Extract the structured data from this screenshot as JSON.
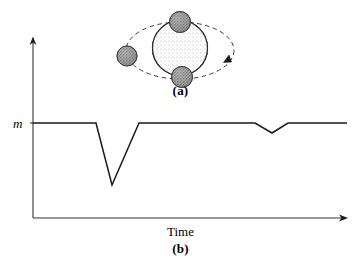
{
  "figure": {
    "panel_a": {
      "caption": "(a)",
      "description": "star-with-three-transiting-planets",
      "orbit_direction_arrow": "clockwise",
      "star": {
        "name": "central-star",
        "cx": 180,
        "cy": 48,
        "r": 27.5,
        "fill": "#f2f2f2",
        "stipple": "light"
      },
      "orbit": {
        "cx": 180,
        "cy": 50.5,
        "rx": 54,
        "ry": 28.5,
        "style": "dashed"
      },
      "planets": [
        {
          "name": "planet-top",
          "cx": 180,
          "cy": 22,
          "r": 10.5,
          "fill": "#9a9a9a"
        },
        {
          "name": "planet-left",
          "cx": 127,
          "cy": 56,
          "r": 10,
          "fill": "#9a9a9a"
        },
        {
          "name": "planet-bottom",
          "cx": 182,
          "cy": 77,
          "r": 10.5,
          "fill": "#9a9a9a"
        }
      ]
    },
    "panel_b": {
      "caption": "(b)",
      "x_axis_title": "Time",
      "y_axis_value_label": "m",
      "description": "brightness-vs-time-transit-light-curve"
    },
    "colors": {
      "ink": "#1a1a1a",
      "axis": "#333333",
      "planet_fill": "#9a9a9a",
      "star_fill": "#f2f2f2",
      "background": "#ffffff"
    }
  },
  "chart_data": {
    "type": "line",
    "title": "",
    "subtitle": "",
    "xlabel": "Time",
    "ylabel": "m",
    "grid": false,
    "legend": null,
    "annotations": [
      {
        "text": "m",
        "role": "baseline-magnitude-tick",
        "x": 0,
        "y": 1.0
      }
    ],
    "axes": {
      "x_origin_px": 33,
      "x_end_px": 347,
      "y_top_px": 38,
      "y_bottom_px": 218,
      "x_arrow": true,
      "y_arrow": true,
      "ticks": []
    },
    "xlim": [
      0,
      100
    ],
    "ylim": [
      0,
      1.15
    ],
    "series": [
      {
        "name": "transit-light-curve",
        "x": [
          0,
          20,
          25,
          30,
          35,
          71,
          76,
          81,
          100
        ],
        "y": [
          1.0,
          1.0,
          1.0,
          0.655,
          1.0,
          1.0,
          0.945,
          1.0,
          1.0
        ],
        "points_px": [
          [
            33,
            123
          ],
          [
            96,
            123
          ],
          [
            112,
            185
          ],
          [
            139,
            123
          ],
          [
            255,
            123
          ],
          [
            272,
            133
          ],
          [
            288,
            123
          ],
          [
            347,
            123
          ]
        ],
        "baseline_value": 1.0,
        "dips": [
          {
            "name": "deep-transit-dip",
            "depth_fraction": 0.345,
            "center_x": 25,
            "shape": "v"
          },
          {
            "name": "shallow-transit-dip",
            "depth_fraction": 0.055,
            "center_x": 76,
            "shape": "v"
          }
        ]
      }
    ]
  }
}
